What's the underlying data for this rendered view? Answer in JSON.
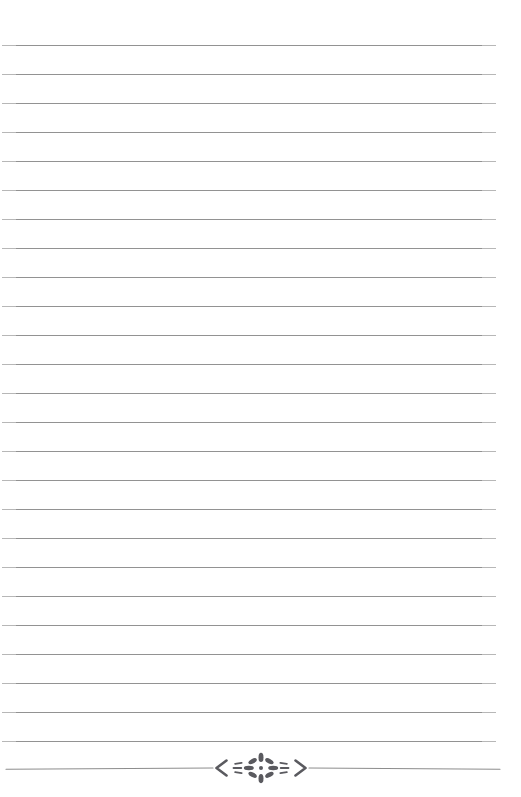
{
  "page": {
    "name": "blank-lined-page",
    "width": 521,
    "height": 797,
    "background_color": "#ffffff",
    "paper_type": "ruled-notepaper",
    "text_content": "",
    "visible_text": ""
  },
  "rules": {
    "name": "ruled-lines",
    "count": 25,
    "color": "#8d8d8d",
    "thickness_px": 1,
    "first_line_y": 45,
    "spacing_px": 29,
    "left_x": 2,
    "right_x": 496,
    "line_length_px": 494,
    "y_positions": [
      45,
      74,
      103,
      132,
      161,
      190,
      219,
      248,
      277,
      306,
      335,
      364,
      393,
      422,
      451,
      480,
      509,
      538,
      567,
      596,
      625,
      654,
      683,
      712,
      741
    ]
  },
  "ornament": {
    "name": "floral-divider-ornament",
    "y": 768,
    "color": "#5a5a5f",
    "rule_color": "#8d8d8d",
    "rule_left_x": 6,
    "rule_right_x": 500,
    "center_x": 261,
    "motif": "starburst-flourish",
    "left_bracket_glyph": "‹",
    "right_bracket_glyph": "›",
    "petal_count": 8,
    "side_dash_count": 6,
    "description": "Angle brackets flanking a radiating petal starburst on a hairline rule"
  }
}
